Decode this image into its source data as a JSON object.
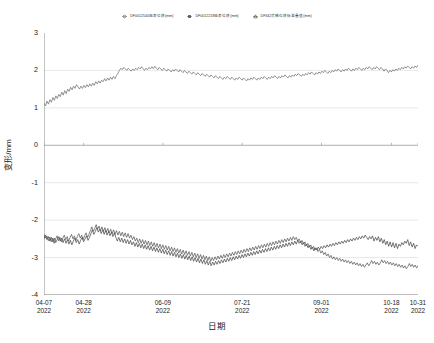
{
  "chart_data": {
    "type": "line",
    "title": "",
    "xlabel": "日期",
    "ylabel": "变形/mm",
    "ylim": [
      -4,
      3
    ],
    "yticks": [
      3,
      2,
      1,
      0,
      -1,
      -2,
      -3,
      -4
    ],
    "xtick_labels": [
      {
        "date": "04-07",
        "year": "2022"
      },
      {
        "date": "04-28",
        "year": "2022"
      },
      {
        "date": "06-09",
        "year": "2022"
      },
      {
        "date": "07-21",
        "year": "2022"
      },
      {
        "date": "09-01",
        "year": "2022"
      },
      {
        "date": "10-18",
        "year": "2022"
      },
      {
        "date": "10-31",
        "year": "2022"
      }
    ],
    "xtick_positions": [
      0,
      0.106,
      0.318,
      0.53,
      0.742,
      0.929,
      1.0
    ],
    "grid": true,
    "grid_color": "#d9d9d9",
    "axis_color": "#808080",
    "legend_position": "top-center",
    "series": [
      {
        "name": "DF0012540地表位移(mm)",
        "marker": "circle",
        "color": "#6f6f6f",
        "values": [
          1.12,
          1.05,
          1.18,
          1.1,
          1.22,
          1.15,
          1.28,
          1.2,
          1.32,
          1.25,
          1.36,
          1.3,
          1.42,
          1.34,
          1.46,
          1.38,
          1.5,
          1.44,
          1.55,
          1.48,
          1.58,
          1.52,
          1.62,
          1.56,
          1.5,
          1.58,
          1.52,
          1.6,
          1.54,
          1.62,
          1.56,
          1.64,
          1.58,
          1.66,
          1.6,
          1.7,
          1.64,
          1.72,
          1.66,
          1.74,
          1.7,
          1.78,
          1.72,
          1.8,
          1.74,
          1.82,
          1.76,
          1.84,
          1.78,
          1.86,
          1.92,
          2.0,
          2.06,
          2.02,
          2.08,
          2.04,
          2.0,
          2.06,
          2.02,
          1.98,
          2.04,
          2.0,
          2.06,
          2.02,
          2.08,
          2.04,
          2.1,
          2.05,
          2.0,
          2.06,
          2.02,
          2.08,
          2.04,
          2.1,
          2.05,
          2.11,
          2.06,
          2.02,
          2.08,
          2.04,
          2.0,
          2.06,
          2.02,
          1.98,
          2.04,
          2.0,
          1.96,
          2.02,
          1.98,
          2.04,
          2.0,
          1.96,
          2.02,
          1.98,
          1.94,
          2.0,
          1.96,
          1.92,
          1.98,
          1.94,
          1.9,
          1.96,
          1.92,
          1.88,
          1.94,
          1.9,
          1.86,
          1.92,
          1.88,
          1.84,
          1.9,
          1.86,
          1.82,
          1.88,
          1.84,
          1.8,
          1.86,
          1.82,
          1.78,
          1.84,
          1.8,
          1.76,
          1.82,
          1.78,
          1.84,
          1.8,
          1.76,
          1.82,
          1.78,
          1.74,
          1.8,
          1.76,
          1.82,
          1.78,
          1.74,
          1.8,
          1.76,
          1.72,
          1.78,
          1.74,
          1.8,
          1.76,
          1.82,
          1.78,
          1.74,
          1.8,
          1.76,
          1.82,
          1.78,
          1.84,
          1.8,
          1.76,
          1.82,
          1.78,
          1.84,
          1.8,
          1.86,
          1.82,
          1.78,
          1.84,
          1.8,
          1.86,
          1.82,
          1.88,
          1.84,
          1.8,
          1.86,
          1.82,
          1.88,
          1.84,
          1.9,
          1.86,
          1.92,
          1.88,
          1.84,
          1.9,
          1.86,
          1.92,
          1.88,
          1.94,
          1.9,
          1.96,
          1.92,
          1.88,
          1.94,
          1.9,
          1.96,
          1.92,
          1.98,
          1.94,
          2.0,
          1.96,
          1.92,
          1.98,
          1.94,
          2.0,
          1.96,
          2.02,
          1.98,
          2.04,
          2.0,
          1.96,
          2.02,
          1.98,
          2.04,
          2.0,
          2.06,
          2.02,
          1.98,
          2.04,
          2.0,
          2.06,
          2.02,
          2.08,
          2.04,
          2.0,
          2.06,
          2.02,
          2.08,
          2.04,
          2.1,
          2.06,
          2.02,
          2.08,
          2.04,
          2.1,
          2.06,
          2.02,
          2.08,
          2.04,
          1.98,
          2.04,
          2.0,
          1.94,
          2.0,
          1.96,
          2.02,
          1.98,
          2.04,
          2.0,
          2.06,
          2.02,
          2.08,
          2.04,
          2.1,
          2.06,
          2.12,
          2.08,
          2.04,
          2.1,
          2.06,
          2.12,
          2.08,
          2.14
        ]
      },
      {
        "name": "DF0012218地表位移(mm)",
        "marker": "square",
        "color": "#5a5a5a",
        "values": [
          -2.38,
          -2.48,
          -2.42,
          -2.55,
          -2.45,
          -2.58,
          -2.48,
          -2.62,
          -2.5,
          -2.42,
          -2.55,
          -2.46,
          -2.58,
          -2.48,
          -2.4,
          -2.52,
          -2.44,
          -2.56,
          -2.46,
          -2.38,
          -2.5,
          -2.42,
          -2.54,
          -2.44,
          -2.36,
          -2.48,
          -2.4,
          -2.52,
          -2.42,
          -2.34,
          -2.46,
          -2.38,
          -2.28,
          -2.18,
          -2.3,
          -2.22,
          -2.12,
          -2.24,
          -2.16,
          -2.28,
          -2.18,
          -2.3,
          -2.2,
          -2.32,
          -2.22,
          -2.34,
          -2.24,
          -2.36,
          -2.26,
          -2.38,
          -2.28,
          -2.4,
          -2.3,
          -2.42,
          -2.32,
          -2.44,
          -2.34,
          -2.46,
          -2.36,
          -2.48,
          -2.4,
          -2.52,
          -2.44,
          -2.56,
          -2.48,
          -2.6,
          -2.5,
          -2.62,
          -2.52,
          -2.64,
          -2.54,
          -2.66,
          -2.56,
          -2.68,
          -2.58,
          -2.7,
          -2.6,
          -2.72,
          -2.62,
          -2.74,
          -2.64,
          -2.76,
          -2.66,
          -2.78,
          -2.68,
          -2.8,
          -2.7,
          -2.82,
          -2.72,
          -2.84,
          -2.74,
          -2.86,
          -2.76,
          -2.88,
          -2.78,
          -2.9,
          -2.8,
          -2.92,
          -2.82,
          -2.94,
          -2.84,
          -2.96,
          -2.86,
          -2.98,
          -2.88,
          -3.0,
          -2.9,
          -3.02,
          -2.92,
          -3.04,
          -2.94,
          -3.06,
          -2.96,
          -3.08,
          -2.98,
          -3.1,
          -3.0,
          -3.08,
          -2.98,
          -3.06,
          -2.96,
          -3.04,
          -2.94,
          -3.02,
          -2.92,
          -3.0,
          -2.9,
          -2.98,
          -2.88,
          -2.96,
          -2.86,
          -2.94,
          -2.84,
          -2.92,
          -2.82,
          -2.9,
          -2.8,
          -2.88,
          -2.78,
          -2.86,
          -2.76,
          -2.84,
          -2.74,
          -2.82,
          -2.72,
          -2.8,
          -2.7,
          -2.78,
          -2.68,
          -2.76,
          -2.66,
          -2.74,
          -2.64,
          -2.72,
          -2.62,
          -2.7,
          -2.6,
          -2.68,
          -2.58,
          -2.66,
          -2.56,
          -2.64,
          -2.54,
          -2.62,
          -2.52,
          -2.6,
          -2.5,
          -2.58,
          -2.48,
          -2.56,
          -2.46,
          -2.54,
          -2.44,
          -2.52,
          -2.46,
          -2.56,
          -2.5,
          -2.6,
          -2.54,
          -2.64,
          -2.58,
          -2.68,
          -2.62,
          -2.72,
          -2.66,
          -2.76,
          -2.7,
          -2.8,
          -2.74,
          -2.84,
          -2.78,
          -2.88,
          -2.82,
          -2.92,
          -2.86,
          -2.96,
          -2.9,
          -3.0,
          -2.94,
          -3.04,
          -2.98,
          -3.06,
          -3.0,
          -3.08,
          -3.02,
          -3.1,
          -3.04,
          -3.12,
          -3.06,
          -3.14,
          -3.08,
          -3.16,
          -3.1,
          -3.18,
          -3.12,
          -3.2,
          -3.14,
          -3.22,
          -3.16,
          -3.24,
          -3.18,
          -3.26,
          -3.2,
          -3.14,
          -3.22,
          -3.16,
          -3.08,
          -3.16,
          -3.1,
          -3.18,
          -3.12,
          -3.2,
          -3.14,
          -3.06,
          -3.14,
          -3.08,
          -3.16,
          -3.1,
          -3.18,
          -3.12,
          -3.2,
          -3.14,
          -3.22,
          -3.16,
          -3.24,
          -3.18,
          -3.26,
          -3.2,
          -3.28,
          -3.22,
          -3.3,
          -3.24,
          -3.16,
          -3.24,
          -3.18,
          -3.26,
          -3.2,
          -3.28,
          -3.22
        ]
      },
      {
        "name": "DF342货梯位移标准量值(mm)",
        "marker": "triangle",
        "color": "#4a4a4a",
        "values": [
          -2.5,
          -2.4,
          -2.52,
          -2.44,
          -2.56,
          -2.46,
          -2.58,
          -2.48,
          -2.6,
          -2.52,
          -2.44,
          -2.56,
          -2.48,
          -2.6,
          -2.5,
          -2.62,
          -2.52,
          -2.64,
          -2.54,
          -2.66,
          -2.56,
          -2.48,
          -2.6,
          -2.52,
          -2.64,
          -2.54,
          -2.46,
          -2.58,
          -2.5,
          -2.42,
          -2.54,
          -2.46,
          -2.36,
          -2.26,
          -2.38,
          -2.3,
          -2.2,
          -2.32,
          -2.24,
          -2.36,
          -2.26,
          -2.38,
          -2.28,
          -2.4,
          -2.3,
          -2.42,
          -2.32,
          -2.44,
          -2.34,
          -2.46,
          -2.56,
          -2.46,
          -2.58,
          -2.48,
          -2.6,
          -2.5,
          -2.62,
          -2.52,
          -2.64,
          -2.54,
          -2.66,
          -2.58,
          -2.7,
          -2.6,
          -2.72,
          -2.62,
          -2.74,
          -2.64,
          -2.76,
          -2.66,
          -2.78,
          -2.68,
          -2.8,
          -2.7,
          -2.82,
          -2.72,
          -2.84,
          -2.74,
          -2.86,
          -2.76,
          -2.88,
          -2.78,
          -2.9,
          -2.8,
          -2.92,
          -2.82,
          -2.94,
          -2.84,
          -2.96,
          -2.86,
          -2.98,
          -2.88,
          -3.0,
          -2.9,
          -3.02,
          -2.92,
          -3.04,
          -2.94,
          -3.06,
          -2.96,
          -3.08,
          -2.98,
          -3.1,
          -3.0,
          -3.12,
          -3.02,
          -3.14,
          -3.04,
          -3.16,
          -3.06,
          -3.18,
          -3.08,
          -3.2,
          -3.1,
          -3.22,
          -3.12,
          -3.2,
          -3.1,
          -3.18,
          -3.08,
          -3.16,
          -3.06,
          -3.14,
          -3.04,
          -3.12,
          -3.02,
          -3.1,
          -3.0,
          -3.08,
          -2.98,
          -3.06,
          -2.96,
          -3.04,
          -2.94,
          -3.02,
          -2.92,
          -3.0,
          -2.9,
          -2.98,
          -2.88,
          -2.96,
          -2.86,
          -2.94,
          -2.84,
          -2.92,
          -2.82,
          -2.9,
          -2.8,
          -2.88,
          -2.78,
          -2.86,
          -2.76,
          -2.84,
          -2.74,
          -2.82,
          -2.72,
          -2.8,
          -2.7,
          -2.78,
          -2.68,
          -2.76,
          -2.66,
          -2.74,
          -2.64,
          -2.72,
          -2.62,
          -2.7,
          -2.6,
          -2.68,
          -2.58,
          -2.66,
          -2.56,
          -2.64,
          -2.54,
          -2.62,
          -2.56,
          -2.66,
          -2.6,
          -2.7,
          -2.64,
          -2.74,
          -2.68,
          -2.78,
          -2.72,
          -2.82,
          -2.74,
          -2.8,
          -2.72,
          -2.78,
          -2.7,
          -2.76,
          -2.68,
          -2.74,
          -2.66,
          -2.72,
          -2.64,
          -2.7,
          -2.62,
          -2.68,
          -2.6,
          -2.66,
          -2.58,
          -2.64,
          -2.56,
          -2.62,
          -2.54,
          -2.6,
          -2.52,
          -2.58,
          -2.5,
          -2.56,
          -2.48,
          -2.54,
          -2.46,
          -2.52,
          -2.44,
          -2.5,
          -2.42,
          -2.48,
          -2.4,
          -2.46,
          -2.52,
          -2.44,
          -2.5,
          -2.42,
          -2.56,
          -2.46,
          -2.54,
          -2.44,
          -2.58,
          -2.48,
          -2.62,
          -2.52,
          -2.66,
          -2.56,
          -2.7,
          -2.58,
          -2.72,
          -2.6,
          -2.74,
          -2.62,
          -2.76,
          -2.64,
          -2.7,
          -2.6,
          -2.66,
          -2.56,
          -2.62,
          -2.52,
          -2.68,
          -2.58,
          -2.72,
          -2.62,
          -2.76,
          -2.66,
          -2.7
        ]
      }
    ]
  },
  "legend": {
    "items": [
      {
        "label": "DF0012540地表位移(mm)",
        "marker": "circle-marker-icon"
      },
      {
        "label": "DF0012218地表位移(mm)",
        "marker": "square-marker-icon"
      },
      {
        "label": "DF342货梯位移标准量值(mm)",
        "marker": "triangle-marker-icon"
      }
    ]
  }
}
